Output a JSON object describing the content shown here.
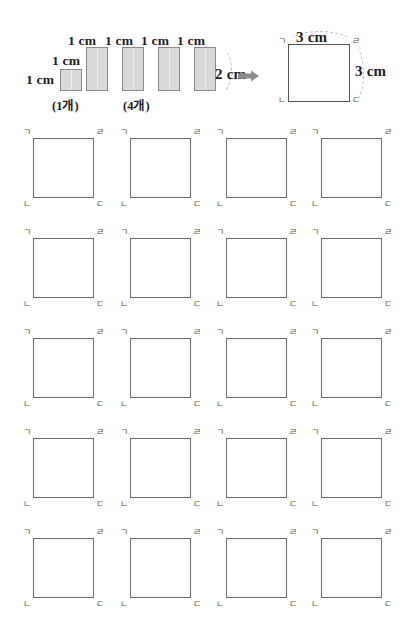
{
  "worksheet": {
    "header": {
      "pieces": [
        {
          "label_top": "1 cm",
          "label_left": "1 cm",
          "count_label": "(1개)",
          "kind": "unit-square"
        },
        {
          "label_top": "1 cm",
          "kind": "strip"
        },
        {
          "label_top": "1 cm",
          "kind": "strip"
        },
        {
          "label_top": "1 cm",
          "kind": "strip"
        },
        {
          "label_top": "1 cm",
          "kind": "strip"
        }
      ],
      "strip_group_count_label": "(4개)",
      "strip_height_label": "2 cm",
      "arrow_icon": "right-arrow-icon",
      "result": {
        "top_label": "3 cm",
        "right_label": "3 cm",
        "vertices": {
          "top_left": "ㄱ",
          "top_right": "ㄹ",
          "bottom_left": "ㄴ",
          "bottom_right": "ㄷ"
        }
      }
    },
    "grid": {
      "rows": 5,
      "columns": 4,
      "vertices": {
        "top_left": "ㄱ",
        "top_right": "ㄹ",
        "bottom_left": "ㄴ",
        "bottom_right": "ㄷ"
      }
    },
    "colors": {
      "strip_fill": "#d9d9d9",
      "strip_stroke": "#8a8a8a",
      "square_stroke": "#6b6b6b",
      "arc_stroke": "#b6b6b6",
      "arrow_fill": "#8c8c8c",
      "text": "#1d1d1d",
      "vertex_text": "#555555",
      "page_background": "#ffffff"
    }
  }
}
